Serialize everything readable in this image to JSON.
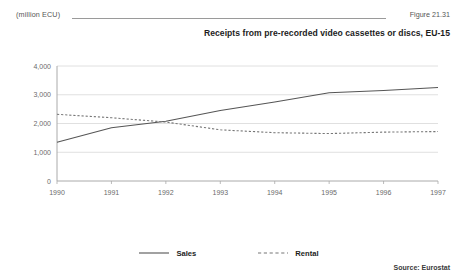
{
  "header": {
    "unit_label": "(million ECU)",
    "figure_number": "Figure 21.31"
  },
  "source": {
    "text": "Source: Eurostat"
  },
  "legend": {
    "position": "bottom-center",
    "items": [
      {
        "label": "Sales",
        "style": "solid",
        "color": "#555555",
        "icon": "solid-line-icon"
      },
      {
        "label": "Rental",
        "style": "dashed",
        "color": "#777777",
        "icon": "dashed-line-icon"
      }
    ]
  },
  "chart_data": {
    "type": "line",
    "title": "Receipts from pre-recorded video cassettes or discs, EU-15",
    "xlabel": "",
    "ylabel": "(million ECU)",
    "x": [
      1990,
      1991,
      1992,
      1993,
      1994,
      1995,
      1996,
      1997
    ],
    "xtick_labels": [
      "1990",
      "1991",
      "1992",
      "1993",
      "1994",
      "1995",
      "1996",
      "1997"
    ],
    "ylim": [
      0,
      4000
    ],
    "yticks": [
      0,
      1000,
      2000,
      3000,
      4000
    ],
    "ytick_labels": [
      "0",
      "1,000",
      "2,000",
      "3,000",
      "4,000"
    ],
    "grid": "horizontal",
    "series": [
      {
        "name": "Sales",
        "style": "solid",
        "color": "#555555",
        "values": [
          1350,
          1850,
          2080,
          2450,
          2750,
          3070,
          3150,
          3250
        ]
      },
      {
        "name": "Rental",
        "style": "dashed",
        "color": "#777777",
        "values": [
          2320,
          2200,
          2050,
          1780,
          1680,
          1650,
          1700,
          1720
        ]
      }
    ]
  }
}
